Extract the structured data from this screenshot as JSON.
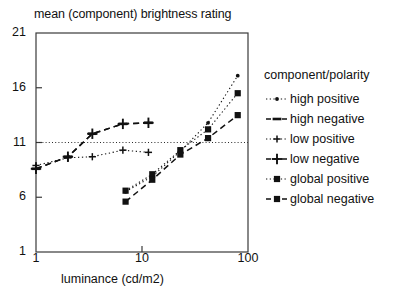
{
  "chart_data": {
    "type": "line",
    "title": "mean (component) brightness rating",
    "xlabel": "luminance (cd/m2)",
    "ylabel": "",
    "xscale": "log",
    "xlim": [
      1,
      100
    ],
    "ylim": [
      1,
      21
    ],
    "xticks": [
      1,
      10,
      100
    ],
    "xtick_labels": [
      "1",
      "10",
      "100"
    ],
    "yticks": [
      1,
      6,
      11,
      16,
      21
    ],
    "ytick_labels": [
      "1",
      "6",
      "11",
      "16",
      "21"
    ],
    "grid": false,
    "reference_lines": [
      {
        "name": "y-11-reference",
        "orientation": "horizontal",
        "value": 11,
        "style": "dotted"
      }
    ],
    "legend_title": "component/polarity",
    "legend_position": "right",
    "series": [
      {
        "name": "high positive",
        "marker": "dot",
        "line": "dotted",
        "points": [
          {
            "x": 7.0,
            "y": 6.5
          },
          {
            "x": 12.5,
            "y": 7.9
          },
          {
            "x": 23.0,
            "y": 10.2
          },
          {
            "x": 42.0,
            "y": 12.8
          },
          {
            "x": 80.0,
            "y": 17.1
          }
        ]
      },
      {
        "name": "high negative",
        "marker": "dash",
        "line": "dashed",
        "points": [
          {
            "x": 1.0,
            "y": 8.6
          },
          {
            "x": 2.0,
            "y": 9.7
          },
          {
            "x": 3.4,
            "y": 11.8
          },
          {
            "x": 6.6,
            "y": 12.7
          },
          {
            "x": 11.5,
            "y": 12.8
          }
        ]
      },
      {
        "name": "low positive",
        "marker": "plus-small",
        "line": "dotted",
        "points": [
          {
            "x": 1.0,
            "y": 8.9
          },
          {
            "x": 2.0,
            "y": 9.6
          },
          {
            "x": 3.4,
            "y": 9.7
          },
          {
            "x": 6.6,
            "y": 10.3
          },
          {
            "x": 11.5,
            "y": 10.1
          }
        ]
      },
      {
        "name": "low negative",
        "marker": "plus-large",
        "line": "dashed",
        "points": [
          {
            "x": 1.0,
            "y": 8.6
          },
          {
            "x": 2.0,
            "y": 9.7
          },
          {
            "x": 3.4,
            "y": 11.8
          },
          {
            "x": 6.6,
            "y": 12.7
          },
          {
            "x": 11.5,
            "y": 12.8
          }
        ]
      },
      {
        "name": "global positive",
        "marker": "square",
        "line": "dotted",
        "points": [
          {
            "x": 7.0,
            "y": 6.6
          },
          {
            "x": 12.5,
            "y": 8.1
          },
          {
            "x": 23.0,
            "y": 10.3
          },
          {
            "x": 42.0,
            "y": 12.2
          },
          {
            "x": 80.0,
            "y": 15.5
          }
        ]
      },
      {
        "name": "global negative",
        "marker": "square-dash",
        "line": "dashed",
        "points": [
          {
            "x": 7.0,
            "y": 5.6
          },
          {
            "x": 12.5,
            "y": 7.6
          },
          {
            "x": 23.0,
            "y": 9.9
          },
          {
            "x": 42.0,
            "y": 11.4
          },
          {
            "x": 80.0,
            "y": 13.5
          }
        ]
      }
    ]
  }
}
